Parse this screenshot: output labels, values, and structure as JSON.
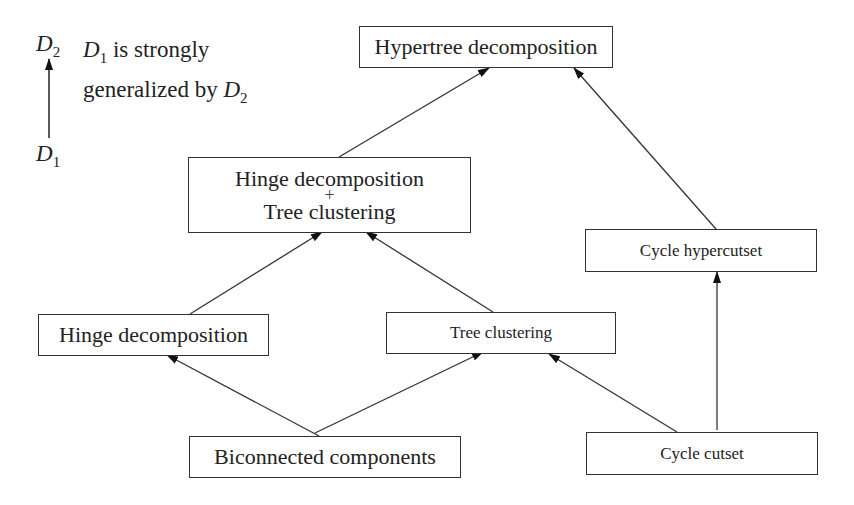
{
  "legend": {
    "top_symbol": "D",
    "top_sub": "2",
    "bottom_symbol": "D",
    "bottom_sub": "1",
    "line1_prefix_symbol": "D",
    "line1_prefix_sub": "1",
    "line1_text": " is strongly",
    "line2_text": "generalized by ",
    "line2_symbol": "D",
    "line2_sub": "2"
  },
  "nodes": {
    "hypertree": {
      "label": "Hypertree decomposition"
    },
    "hinge_tree": {
      "line1": "Hinge decomposition",
      "plus": "+",
      "line2": "Tree clustering"
    },
    "cycle_hypercutset": {
      "label": "Cycle hypercutset"
    },
    "hinge": {
      "label": "Hinge decomposition"
    },
    "tree_clustering": {
      "label": "Tree clustering"
    },
    "biconnected": {
      "label": "Biconnected components"
    },
    "cycle_cutset": {
      "label": "Cycle cutset"
    }
  },
  "edges": [
    {
      "from": "Hinge decomposition + Tree clustering",
      "to": "Hypertree decomposition"
    },
    {
      "from": "Cycle hypercutset",
      "to": "Hypertree decomposition"
    },
    {
      "from": "Hinge decomposition",
      "to": "Hinge decomposition + Tree clustering"
    },
    {
      "from": "Tree clustering",
      "to": "Hinge decomposition + Tree clustering"
    },
    {
      "from": "Biconnected components",
      "to": "Hinge decomposition"
    },
    {
      "from": "Biconnected components",
      "to": "Tree clustering"
    },
    {
      "from": "Cycle cutset",
      "to": "Tree clustering"
    },
    {
      "from": "Cycle cutset",
      "to": "Cycle hypercutset"
    }
  ]
}
